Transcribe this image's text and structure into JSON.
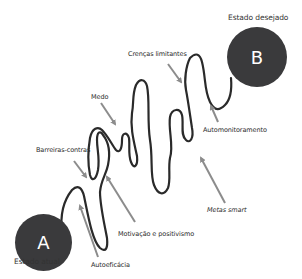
{
  "diagram": {
    "start": {
      "letter": "A",
      "label": "Estado atual"
    },
    "end": {
      "letter": "B",
      "label": "Estado desejado"
    },
    "factors": [
      {
        "id": "crencas",
        "label": "Crenças limitantes"
      },
      {
        "id": "medo",
        "label": "Medo"
      },
      {
        "id": "barreiras",
        "label": "Barreiras-contras"
      },
      {
        "id": "automonitoramento",
        "label": "Automonitoramento"
      },
      {
        "id": "metas",
        "label": "Metas smart"
      },
      {
        "id": "motivacao",
        "label": "Motivação e positivismo"
      },
      {
        "id": "autoeficacia",
        "label": "Autoeficácia"
      }
    ],
    "colors": {
      "circle": "#3a3a3c",
      "path": "#2a2a2a",
      "arrow": "#8c8c8c",
      "text": "#2b2b2b"
    }
  }
}
